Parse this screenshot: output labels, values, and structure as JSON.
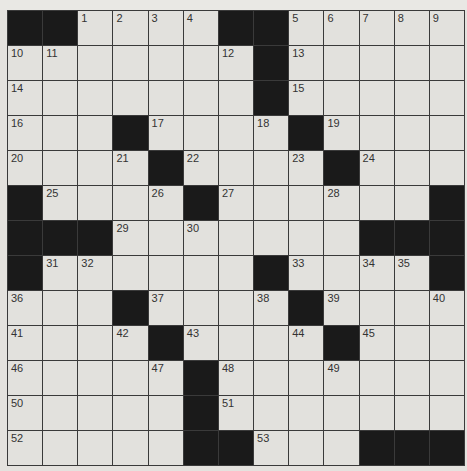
{
  "puzzle": {
    "rows": 13,
    "cols": 13,
    "colors": {
      "black": "#1a1a1a",
      "white": "#e2e1dd",
      "line": "#3a3a3a"
    },
    "grid": [
      "##....##.....",
      ".......#.....",
      ".......#.....",
      "...#....#....",
      "....#....#...",
      "#....#......#",
      "###.......###",
      "#......#....#",
      "...#....#....",
      "....#....#...",
      ".....#.......",
      ".....#.......",
      ".....##...###"
    ],
    "numbers": {
      "0,2": "1",
      "0,3": "2",
      "0,4": "3",
      "0,5": "4",
      "0,8": "5",
      "0,9": "6",
      "0,10": "7",
      "0,11": "8",
      "0,12": "9",
      "1,0": "10",
      "1,1": "11",
      "1,6": "12",
      "1,8": "13",
      "2,0": "14",
      "2,8": "15",
      "3,0": "16",
      "3,4": "17",
      "3,7": "18",
      "3,9": "19",
      "4,0": "20",
      "4,3": "21",
      "4,5": "22",
      "4,8": "23",
      "4,10": "24",
      "5,1": "25",
      "5,4": "26",
      "5,6": "27",
      "5,9": "28",
      "6,3": "29",
      "6,5": "30",
      "7,1": "31",
      "7,2": "32",
      "7,8": "33",
      "7,10": "34",
      "7,11": "35",
      "8,0": "36",
      "8,4": "37",
      "8,7": "38",
      "8,9": "39",
      "8,12": "40",
      "9,0": "41",
      "9,3": "42",
      "9,5": "43",
      "9,8": "44",
      "9,10": "45",
      "10,0": "46",
      "10,4": "47",
      "10,6": "48",
      "10,9": "49",
      "11,0": "50",
      "11,6": "51",
      "12,0": "52",
      "12,7": "53"
    },
    "letters": {}
  }
}
